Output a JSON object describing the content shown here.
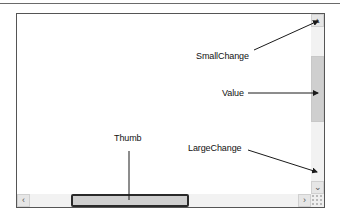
{
  "diagram": {
    "labels": {
      "small_change": "SmallChange",
      "value": "Value",
      "large_change": "LargeChange",
      "thumb": "Thumb"
    },
    "icons": {
      "scroll_up": "▴",
      "scroll_down": "⌄",
      "scroll_left": "‹",
      "scroll_right": "›"
    },
    "colors": {
      "frame_border": "#555555",
      "track": "#f2f2f2",
      "thumb_fill": "#cfcfcf",
      "thumb_border_highlight": "#2a2a2a",
      "callout_line": "#1a1a1a"
    }
  }
}
